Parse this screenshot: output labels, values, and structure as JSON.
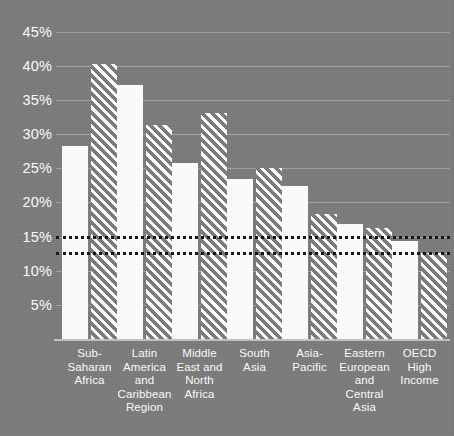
{
  "chart_data": {
    "type": "bar",
    "title": "",
    "xlabel": "",
    "ylabel": "",
    "ylim": [
      0,
      47
    ],
    "grid": true,
    "legend_position": "none",
    "categories": [
      "Sub-Saharan Africa",
      "Latin America and Caribbean Region",
      "Middle East and North Africa",
      "South Asia",
      "Asia-Pacific",
      "Eastern European and Central Asia",
      "OECD High Income"
    ],
    "category_lines": [
      [
        "Sub-Saharan",
        "Africa"
      ],
      [
        "Latin",
        "America",
        "and",
        "Caribbean",
        "Region"
      ],
      [
        "Middle",
        "East and",
        "North",
        "Africa"
      ],
      [
        "South",
        "Asia"
      ],
      [
        "Asia-Pacific"
      ],
      [
        "Eastern",
        "European",
        "and",
        "Central",
        "Asia"
      ],
      [
        "OECD",
        "High",
        "Income"
      ]
    ],
    "series": [
      {
        "name": "solid",
        "style": "solid-white",
        "values": [
          28.3,
          37.2,
          25.8,
          23.4,
          22.4,
          16.9,
          14.3
        ]
      },
      {
        "name": "hatched",
        "style": "diagonal-hatch",
        "values": [
          40.2,
          31.3,
          33.1,
          25.1,
          18.3,
          16.2,
          12.6
        ]
      }
    ],
    "ytick_labels": [
      "45%",
      "40%",
      "35%",
      "30%",
      "25%",
      "20%",
      "15%",
      "10%",
      "5%"
    ],
    "ytick_values": [
      45,
      40,
      35,
      30,
      25,
      20,
      15,
      10,
      5
    ],
    "reference_lines": [
      {
        "name": "upper-reference-line",
        "value": 15.1,
        "style": "dotted",
        "color": "#121212"
      },
      {
        "name": "lower-reference-line",
        "value": 12.8,
        "style": "dotted",
        "color": "#121212"
      }
    ],
    "colors": {
      "background": "#7b7b7b",
      "bar_solid": "#ffffff",
      "bar_hatch": "#ffffff",
      "gridline": "#b4b4b4",
      "reference_line": "#121212",
      "text": "#ffffff"
    }
  }
}
